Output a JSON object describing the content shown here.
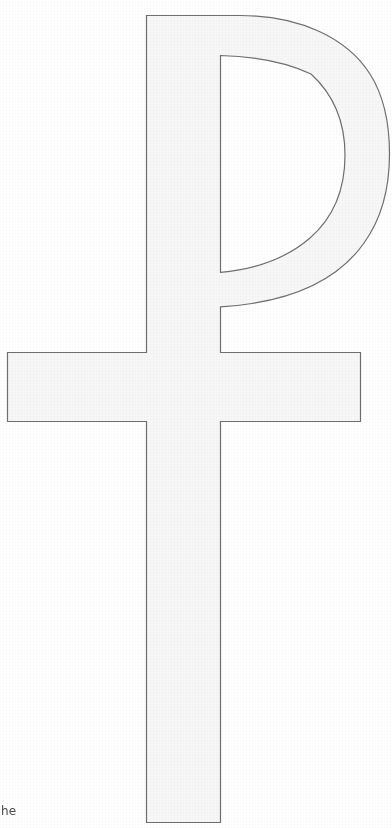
{
  "page": {
    "background_color": "#ffffff",
    "width": 392,
    "height": 828
  },
  "figure": {
    "name": "staurogram",
    "unicode_glyph": "☧",
    "style": "line outline drawing",
    "fill_color": "#f7f7f7",
    "stroke_color": "#6f6f6f",
    "stroke_width": 1,
    "parts": [
      {
        "label": "vertical stem",
        "name": "stem"
      },
      {
        "label": "horizontal crossbar",
        "name": "crossbar"
      },
      {
        "label": "rho loop bowl",
        "name": "bowl"
      },
      {
        "label": "rho loop counter",
        "name": "counter"
      }
    ]
  },
  "text_fragment": {
    "value": "he",
    "note": "cropped running text at bottom-left edge of the page"
  }
}
